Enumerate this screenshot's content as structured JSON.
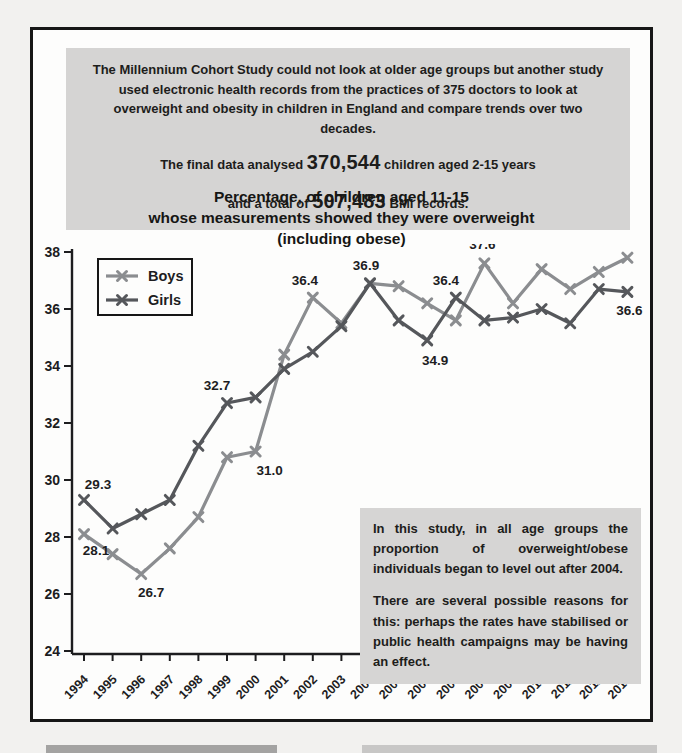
{
  "study_box": {
    "intro": "The Millennium Cohort Study could not look at older age groups but another study used electronic health records from the practices of 375 doctors to look at overweight and obesity in children in England and compare trends over two decades.",
    "final_line1": {
      "prefix": "The final data analysed ",
      "number": "370,544",
      "suffix": " children aged 2-15 years"
    },
    "final_line2": {
      "prefix": "and a total of ",
      "number": "507,483",
      "suffix": " BMI records."
    }
  },
  "chart_data": {
    "type": "line",
    "title": "Percentage, of children aged 11-15\nwhose measurements showed they were overweight\n(including obese)",
    "xlabel": "",
    "ylabel": "",
    "x": [
      1994,
      1995,
      1996,
      1997,
      1998,
      1999,
      2000,
      2001,
      2002,
      2003,
      2004,
      2005,
      2006,
      2007,
      2008,
      2009,
      2010,
      2011,
      2012,
      2013
    ],
    "series": [
      {
        "name": "Boys",
        "color": "#8b8d90",
        "values": [
          28.1,
          27.4,
          26.7,
          27.6,
          28.7,
          30.8,
          31.0,
          34.4,
          36.4,
          35.5,
          36.9,
          36.8,
          36.2,
          35.6,
          37.6,
          36.2,
          37.4,
          36.7,
          37.3,
          37.8
        ]
      },
      {
        "name": "Girls",
        "color": "#55575b",
        "values": [
          29.3,
          28.3,
          28.8,
          29.3,
          31.2,
          32.7,
          32.9,
          33.9,
          34.5,
          35.4,
          36.9,
          35.6,
          34.9,
          36.4,
          35.6,
          35.7,
          36.0,
          35.5,
          36.7,
          36.6
        ]
      }
    ],
    "ylim": [
      24,
      38
    ],
    "ytick_step": 2,
    "grid": false,
    "legend_position": "top-left",
    "point_labels": [
      {
        "series": 1,
        "year": 1994,
        "text": "29.3",
        "dx": 14,
        "dy": -11
      },
      {
        "series": 0,
        "year": 1994,
        "text": "28.1",
        "dx": 12,
        "dy": 21
      },
      {
        "series": 0,
        "year": 1996,
        "text": "26.7",
        "dx": 10,
        "dy": 23
      },
      {
        "series": 1,
        "year": 1999,
        "text": "32.7",
        "dx": -10,
        "dy": -13
      },
      {
        "series": 0,
        "year": 2000,
        "text": "31.0",
        "dx": 14,
        "dy": 23
      },
      {
        "series": 0,
        "year": 2002,
        "text": "36.4",
        "dx": -8,
        "dy": -13
      },
      {
        "series": 0,
        "year": 2004,
        "text": "36.9",
        "dx": -4,
        "dy": -13
      },
      {
        "series": 1,
        "year": 2006,
        "text": "34.9",
        "dx": 8,
        "dy": 25
      },
      {
        "series": 1,
        "year": 2007,
        "text": "36.4",
        "dx": -10,
        "dy": -13
      },
      {
        "series": 0,
        "year": 2008,
        "text": "37.6",
        "dx": -2,
        "dy": -14
      },
      {
        "series": 0,
        "year": 2013,
        "text": "37.8",
        "dx": -6,
        "dy": -14
      },
      {
        "series": 1,
        "year": 2013,
        "text": "36.6",
        "dx": 2,
        "dy": 23
      }
    ]
  },
  "conclusion_box": {
    "paragraph1": "In this study, in all age groups the proportion of overweight/obese individuals began to level out after 2004.",
    "paragraph2": "There are several possible reasons for this: perhaps the rates have stabilised or public health campaigns may be having an effect."
  }
}
